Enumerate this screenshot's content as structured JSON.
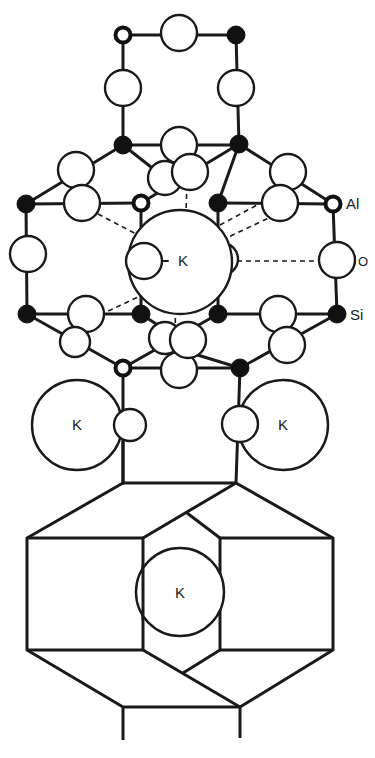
{
  "diagram": {
    "type": "crystal-structure",
    "legend": {
      "al_label": "Al",
      "o_label": "O",
      "si_label": "Si"
    },
    "cations": {
      "k_center": "K",
      "k_left": "K",
      "k_right": "K",
      "k_cage": "K"
    },
    "atom_types": [
      {
        "symbol": "Al",
        "style": "open circle with thick border"
      },
      {
        "symbol": "Si",
        "style": "filled black circle"
      },
      {
        "symbol": "O",
        "style": "large open circle"
      },
      {
        "symbol": "K",
        "style": "very large open circle"
      }
    ],
    "colors": {
      "line": "#1a1a1a",
      "si_fill": "#111111",
      "background": "#ffffff"
    }
  }
}
